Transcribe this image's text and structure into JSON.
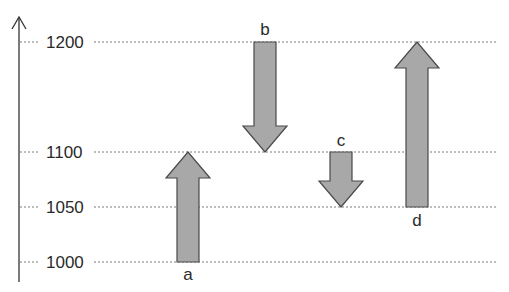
{
  "chart_data": {
    "type": "waterfall-arrows",
    "title": "",
    "xlabel": "",
    "ylabel": "",
    "ylim": [
      1000,
      1200
    ],
    "grid": true,
    "ticks": [
      1000,
      1050,
      1100,
      1200
    ],
    "tick_labels": [
      "1000",
      "1050",
      "1100",
      "1200"
    ],
    "arrows": [
      {
        "label": "a",
        "from": 1000,
        "to": 1100,
        "direction": "up"
      },
      {
        "label": "b",
        "from": 1200,
        "to": 1100,
        "direction": "down"
      },
      {
        "label": "c",
        "from": 1100,
        "to": 1050,
        "direction": "down"
      },
      {
        "label": "d",
        "from": 1050,
        "to": 1200,
        "direction": "up"
      }
    ],
    "colors": {
      "arrow_fill": "#a8a8a8",
      "arrow_stroke": "#4a4a4a",
      "grid": "#7a7a7a",
      "axis": "#333333",
      "text": "#2a2a2a"
    }
  }
}
